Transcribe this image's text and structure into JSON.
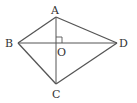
{
  "diagram": {
    "type": "quadrilateral-with-diagonals",
    "points": {
      "A": {
        "label": "A",
        "x": 56,
        "y": 17
      },
      "B": {
        "label": "B",
        "x": 18,
        "y": 43
      },
      "C": {
        "label": "C",
        "x": 56,
        "y": 84
      },
      "D": {
        "label": "D",
        "x": 117,
        "y": 43
      },
      "O": {
        "label": "O",
        "x": 56,
        "y": 43
      }
    },
    "edges": [
      "AB",
      "AD",
      "BC",
      "CD"
    ],
    "diagonals": [
      "AC",
      "BD"
    ],
    "right_angle_at": "O",
    "stroke_color": "#555555"
  }
}
